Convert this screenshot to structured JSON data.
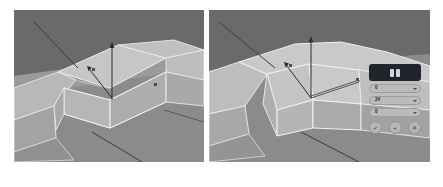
{
  "figure": {
    "caption": "",
    "background_color": "#ffffff"
  },
  "panels": [
    {
      "id": "left",
      "name": "viewport-left",
      "label": "",
      "viewport": {
        "background_upper": "#6a6a6a",
        "background_lower": "#8e8e8e",
        "surface_color": "#b9b9b9",
        "edge_color": "#e9e9e9",
        "gizmo": {
          "axis_label_y": "",
          "axis_label_x": "",
          "handle_color": "#2e2e2e"
        }
      },
      "widget": null
    },
    {
      "id": "right",
      "name": "viewport-right",
      "label": "",
      "viewport": {
        "background_upper": "#6a6a6a",
        "background_lower": "#8e8e8e",
        "surface_color": "#b9b9b9",
        "edge_color": "#e9e9e9",
        "gizmo": {
          "axis_label_y": "",
          "axis_label_x": "",
          "handle_color": "#2e2e2e"
        }
      },
      "widget": {
        "name": "transform-control-panel",
        "header": {
          "title": "",
          "background": "#20242b",
          "text_color": "#d9dde4"
        },
        "fields": [
          {
            "label": "",
            "value": "0"
          },
          {
            "label": "",
            "value": "24"
          },
          {
            "label": "",
            "value": "0"
          }
        ],
        "buttons": [
          {
            "name": "confirm-button",
            "glyph": "✓"
          },
          {
            "name": "add-button",
            "glyph": "+"
          },
          {
            "name": "cancel-button",
            "glyph": "✕"
          }
        ]
      }
    }
  ]
}
